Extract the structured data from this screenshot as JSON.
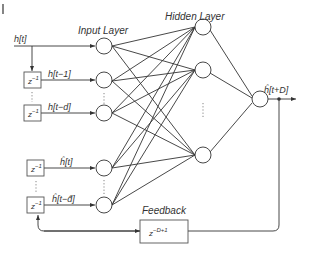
{
  "title_marker": "|",
  "layers": {
    "input_label": "Input Layer",
    "hidden_label": "Hidden Layer",
    "feedback_label": "Feedback"
  },
  "signals": {
    "input_current": "h[t]",
    "input_delay_1": "h[t−1]",
    "input_delay_d": "h[t−d]",
    "feedback_current": "ĥ[t]",
    "feedback_delay_d": "ĥ[t−d̂]",
    "output": "ĥ[t+D]"
  },
  "delay_box_label": "z",
  "delay_box_exp": "−1",
  "feedback_box_label": "z",
  "feedback_box_exp": "−D+1",
  "ellipsis": "⋮",
  "colors": {
    "line": "#333333",
    "node_fill": "#ffffff",
    "text": "#333333"
  }
}
